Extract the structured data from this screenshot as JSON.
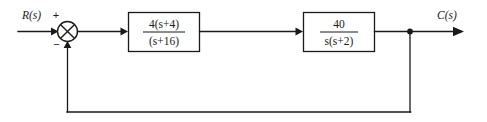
{
  "diagram": {
    "type": "control-system-block-diagram",
    "background_color": "#ffffff",
    "line_color": "#1a1a1a",
    "input": {
      "label": "R(s)",
      "name": "reference-input"
    },
    "output": {
      "label": "C(s)",
      "name": "controlled-output"
    },
    "summing_junction": {
      "name": "summing-junction",
      "plus_sign": "+",
      "minus_sign": "−",
      "style": "circle-with-x"
    },
    "blocks": [
      {
        "name": "compensator-block",
        "numerator_prefix": "4",
        "numerator": "(s+4)",
        "numerator_full": "4(s+4)",
        "denominator": "(s+16)",
        "transfer_function": "4(s+4)/(s+16)"
      },
      {
        "name": "plant-block",
        "numerator_prefix": "",
        "numerator": "40",
        "numerator_full": "40",
        "denominator": "s(s+2)",
        "transfer_function": "40/(s(s+2))"
      }
    ],
    "feedback": {
      "name": "unity-feedback-path",
      "gain": "1",
      "has_block": false,
      "takeoff_point_label": ""
    }
  }
}
